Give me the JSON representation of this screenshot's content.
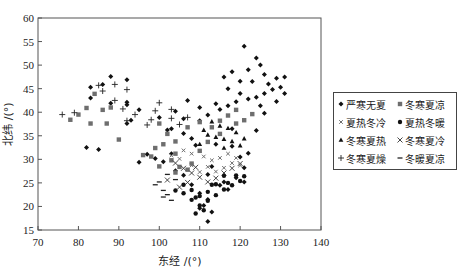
{
  "chart_data": {
    "type": "scatter",
    "title": "",
    "xlabel": "东经 /(°)",
    "ylabel": "北纬 /(°)",
    "xlim": [
      70,
      140
    ],
    "ylim": [
      15,
      60
    ],
    "xticks": [
      70,
      80,
      90,
      100,
      110,
      120,
      130,
      140
    ],
    "yticks": [
      15,
      20,
      25,
      30,
      35,
      40,
      45,
      50,
      55,
      60
    ],
    "grid": false,
    "legend_position": "right",
    "series": [
      {
        "name": "严寒无夏",
        "marker": "diamond",
        "points": [
          [
            83,
            45.3
          ],
          [
            86,
            45.9
          ],
          [
            88,
            47.6
          ],
          [
            92,
            46.9
          ],
          [
            83,
            43
          ],
          [
            88,
            41.9
          ],
          [
            92,
            41.6
          ],
          [
            92,
            42.1
          ],
          [
            93,
            38.3
          ],
          [
            92,
            37.6
          ],
          [
            82,
            32.5
          ],
          [
            85,
            32.1
          ],
          [
            95,
            40.5
          ],
          [
            104,
            40.2
          ],
          [
            107,
            42.5
          ],
          [
            110,
            41
          ],
          [
            114,
            41.8
          ],
          [
            117,
            45
          ],
          [
            120,
            44
          ],
          [
            121,
            54
          ],
          [
            124,
            51.5
          ],
          [
            125,
            50
          ],
          [
            122,
            49
          ],
          [
            118,
            48.6
          ],
          [
            116,
            47.5
          ],
          [
            126,
            48
          ],
          [
            127,
            46
          ],
          [
            123,
            46.5
          ],
          [
            120,
            46.6
          ],
          [
            129,
            47.2
          ],
          [
            130,
            45.3
          ],
          [
            131,
            47.5
          ],
          [
            128,
            44.8
          ],
          [
            126,
            44
          ],
          [
            124,
            43.2
          ],
          [
            122,
            42.8
          ],
          [
            119,
            42.2
          ],
          [
            117,
            41.4
          ],
          [
            115,
            40.6
          ],
          [
            112,
            39.4
          ],
          [
            110,
            38.2
          ],
          [
            106,
            38.6
          ],
          [
            103,
            36.5
          ],
          [
            100,
            38.9
          ],
          [
            102,
            36.2
          ],
          [
            106,
            35.5
          ],
          [
            108,
            34.4
          ],
          [
            109,
            33
          ],
          [
            103,
            31.2
          ],
          [
            101,
            29.5
          ],
          [
            99,
            30.2
          ],
          [
            97,
            31.1
          ],
          [
            95,
            29.4
          ],
          [
            104,
            27.6
          ],
          [
            106,
            26.6
          ],
          [
            112,
            26.8
          ],
          [
            115,
            24.5
          ],
          [
            110,
            22.8
          ],
          [
            112,
            21.5
          ],
          [
            111,
            20.2
          ],
          [
            110,
            19.6
          ],
          [
            113,
            18.8
          ],
          [
            112,
            16.8
          ],
          [
            117,
            23.6
          ],
          [
            119,
            26.1
          ],
          [
            121,
            28.2
          ],
          [
            120,
            30.5
          ],
          [
            118,
            32.8
          ],
          [
            122,
            31.3
          ],
          [
            124,
            36.1
          ],
          [
            126,
            39.8
          ],
          [
            118,
            36.5
          ],
          [
            114,
            33.2
          ],
          [
            108,
            24.6
          ],
          [
            116,
            25.2
          ],
          [
            121,
            25.2
          ],
          [
            113,
            28.5
          ],
          [
            125,
            41.4
          ],
          [
            131,
            44
          ],
          [
            129,
            42.3
          ]
        ]
      },
      {
        "name": "冬寒夏凉",
        "marker": "square",
        "points": [
          [
            82,
            40.9
          ],
          [
            80,
            39.5
          ],
          [
            78,
            38.4
          ],
          [
            83,
            37.6
          ],
          [
            87,
            37.6
          ],
          [
            84,
            43.9
          ],
          [
            88,
            41
          ],
          [
            90,
            34.2
          ],
          [
            86,
            40.5
          ],
          [
            100,
            37.6
          ],
          [
            102,
            35.4
          ],
          [
            104,
            33.8
          ],
          [
            101,
            33.2
          ],
          [
            99,
            32.4
          ],
          [
            98,
            30.6
          ],
          [
            96,
            30.9
          ],
          [
            100,
            28.5
          ],
          [
            103,
            29.8
          ],
          [
            104,
            31.2
          ],
          [
            107,
            36.8
          ],
          [
            110,
            37.9
          ],
          [
            113,
            36.8
          ],
          [
            115,
            38.2
          ],
          [
            117,
            39.3
          ],
          [
            119,
            40.5
          ],
          [
            121,
            38.3
          ],
          [
            123,
            39.6
          ],
          [
            105,
            28.4
          ],
          [
            108,
            29.1
          ],
          [
            104,
            27.2
          ],
          [
            107,
            27.8
          ],
          [
            110,
            31.8
          ],
          [
            112,
            33.7
          ],
          [
            115,
            35.4
          ],
          [
            119,
            37.6
          ]
        ]
      },
      {
        "name": "夏热冬冷",
        "marker": "xsmall",
        "points": [
          [
            106,
            31.9
          ],
          [
            108,
            31.2
          ],
          [
            111,
            30.6
          ],
          [
            113,
            29.8
          ],
          [
            115,
            30.3
          ],
          [
            117,
            31.2
          ],
          [
            119,
            30.3
          ],
          [
            120,
            28.7
          ],
          [
            118,
            29.2
          ],
          [
            116,
            28.2
          ],
          [
            114,
            27.4
          ],
          [
            112,
            28.4
          ],
          [
            110,
            27.3
          ],
          [
            108,
            28.7
          ],
          [
            105,
            30.1
          ],
          [
            103,
            30.8
          ]
        ]
      },
      {
        "name": "夏热冬暖",
        "marker": "circle",
        "points": [
          [
            106,
            24.6
          ],
          [
            108,
            23.5
          ],
          [
            110,
            22.2
          ],
          [
            112,
            23.1
          ],
          [
            114,
            22.4
          ],
          [
            116,
            23.6
          ],
          [
            118,
            24.5
          ],
          [
            120,
            25.4
          ],
          [
            119,
            26.6
          ],
          [
            117,
            25
          ],
          [
            113,
            24.6
          ],
          [
            109,
            21.9
          ],
          [
            110,
            20.2
          ],
          [
            111,
            19.2
          ],
          [
            109,
            18.5
          ],
          [
            112,
            21.2
          ],
          [
            114,
            24.7
          ],
          [
            116,
            26.5
          ],
          [
            121,
            26.4
          ],
          [
            108,
            21.4
          ],
          [
            106,
            22.8
          ],
          [
            104,
            23.4
          ]
        ]
      },
      {
        "name": "冬寒夏热",
        "marker": "triangle",
        "points": [
          [
            112,
            35.2
          ],
          [
            114,
            34.7
          ],
          [
            116,
            34.3
          ],
          [
            118,
            33.8
          ],
          [
            120,
            32.9
          ],
          [
            117,
            36.6
          ],
          [
            115,
            37.1
          ],
          [
            113,
            38
          ],
          [
            111,
            36.2
          ],
          [
            119,
            35.7
          ],
          [
            121,
            34.4
          ],
          [
            116,
            32.4
          ],
          [
            110,
            33.2
          ]
        ]
      },
      {
        "name": "冬寒夏冷",
        "marker": "cross",
        "points": [
          [
            104,
            29.2
          ],
          [
            106,
            28.1
          ],
          [
            108,
            27.1
          ],
          [
            110,
            26.2
          ],
          [
            112,
            25.2
          ],
          [
            114,
            26
          ],
          [
            116,
            27.1
          ],
          [
            118,
            28.1
          ],
          [
            120,
            29.1
          ],
          [
            107,
            25.1
          ],
          [
            105,
            24.1
          ],
          [
            102,
            25.6
          ],
          [
            109,
            28.3
          ]
        ]
      },
      {
        "name": "冬寒夏燥",
        "marker": "plus",
        "points": [
          [
            76,
            39.5
          ],
          [
            79,
            39.9
          ],
          [
            85,
            45.7
          ],
          [
            86,
            44.5
          ],
          [
            89,
            45.9
          ],
          [
            92,
            44.8
          ],
          [
            91,
            40.7
          ],
          [
            92,
            38.2
          ],
          [
            89,
            42.5
          ],
          [
            94,
            39.5
          ],
          [
            98,
            38.4
          ],
          [
            100,
            42
          ],
          [
            99,
            40.3
          ],
          [
            103,
            40.6
          ],
          [
            103,
            38.7
          ],
          [
            97,
            37.3
          ],
          [
            107,
            38.9
          ],
          [
            105,
            37.4
          ]
        ]
      },
      {
        "name": "冬暖夏凉",
        "marker": "dash",
        "points": [
          [
            100,
            25.2
          ],
          [
            101,
            23.4
          ],
          [
            102,
            22.5
          ],
          [
            103,
            21.3
          ],
          [
            99,
            24.6
          ],
          [
            102,
            26.8
          ],
          [
            104,
            25.7
          ],
          [
            101,
            22
          ]
        ]
      }
    ]
  },
  "legend": {
    "items": [
      {
        "label": "严寒无夏",
        "marker": "diamond"
      },
      {
        "label": "冬寒夏凉",
        "marker": "square"
      },
      {
        "label": "夏热冬冷",
        "marker": "xsmall"
      },
      {
        "label": "夏热冬暖",
        "marker": "circle"
      },
      {
        "label": "冬寒夏热",
        "marker": "triangle"
      },
      {
        "label": "冬寒夏冷",
        "marker": "cross"
      },
      {
        "label": "冬寒夏燥",
        "marker": "plus"
      },
      {
        "label": "冬暖夏凉",
        "marker": "dash"
      }
    ]
  },
  "colors": {
    "dark": "#111111",
    "gray": "#6e6e6e",
    "axis": "#444444"
  }
}
